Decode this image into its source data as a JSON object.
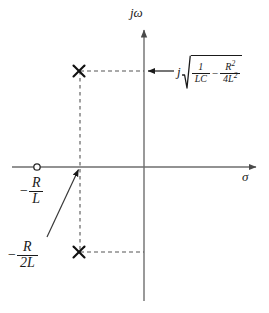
{
  "figure": {
    "type": "pole-zero-plot",
    "title": "",
    "background": "#ffffff",
    "ink_color": "#1a1a1a",
    "axis_color": "#6e6e6e"
  },
  "axes": {
    "real": {
      "name": "sigma-axis",
      "label": "σ",
      "orientation": "horizontal",
      "origin_px": [
        144,
        167
      ],
      "start_px": [
        12,
        167
      ],
      "end_px": [
        258,
        167
      ],
      "arrow": "right",
      "label_px": [
        243,
        172
      ]
    },
    "imag": {
      "name": "jomega-axis",
      "label": "jω",
      "orientation": "vertical",
      "start_px": [
        144,
        301
      ],
      "end_px": [
        144,
        28
      ],
      "arrow": "up",
      "label_px": [
        132,
        7
      ]
    }
  },
  "markers": {
    "zero": {
      "symbol": "o",
      "label": "zero-marker",
      "px": [
        37,
        167
      ],
      "annotation": {
        "minus": "−",
        "numerator": "R",
        "denominator": "L",
        "expression": "-R/L"
      },
      "annotation_px": [
        22,
        178
      ]
    },
    "poles": [
      {
        "symbol": "×",
        "label": "upper-pole",
        "px": [
          79,
          71
        ]
      },
      {
        "symbol": "×",
        "label": "lower-pole",
        "px": [
          79,
          252
        ]
      }
    ]
  },
  "annotations": {
    "damping": {
      "minus": "−",
      "numerator": "R",
      "denominator": "2L",
      "expression": "-R/2L",
      "px": [
        10,
        242
      ],
      "pointer_from_px": [
        48,
        236
      ],
      "pointer_to_px": [
        80,
        168
      ]
    },
    "natural_frequency": {
      "j": "j",
      "radicand": {
        "term1": {
          "numerator": "1",
          "denominator": "LC"
        },
        "operator": "−",
        "term2": {
          "numerator": "R",
          "numerator_exp": "2",
          "denominator": "4L",
          "denominator_exp": "2"
        }
      },
      "expression": "j√(1/LC − R²/4L²)",
      "px": [
        178,
        54
      ],
      "arrow_from_px": [
        172,
        71
      ],
      "arrow_to_px": [
        145,
        71
      ],
      "arrow_direction": "left"
    }
  },
  "guides": [
    {
      "name": "upper-horizontal-dashed",
      "from_px": [
        80,
        71
      ],
      "to_px": [
        144,
        71
      ]
    },
    {
      "name": "lower-horizontal-dashed",
      "from_px": [
        80,
        252
      ],
      "to_px": [
        144,
        252
      ]
    },
    {
      "name": "vertical-dashed",
      "from_px": [
        80,
        71
      ],
      "to_px": [
        80,
        252
      ]
    }
  ]
}
